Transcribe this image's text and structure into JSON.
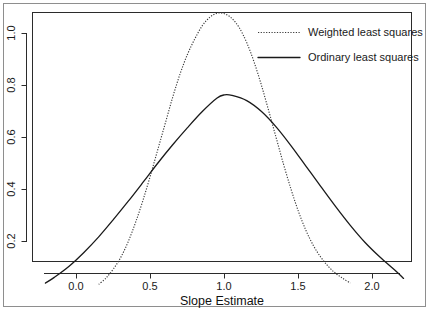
{
  "chart_data": {
    "type": "line",
    "title": "",
    "subtitle": "",
    "xlabel": "Slope Estimate",
    "ylabel": "",
    "xlim": [
      -0.33,
      2.33
    ],
    "ylim": [
      0.0,
      1.13
    ],
    "xticks": [
      0.0,
      0.5,
      1.0,
      1.5,
      2.0
    ],
    "xtick_labels": [
      "0.0",
      "0.5",
      "1.0",
      "1.5",
      "2.0"
    ],
    "yticks": [
      0.2,
      0.4,
      0.6,
      0.8,
      1.0
    ],
    "ytick_labels": [
      "0.2",
      "0.4",
      "0.6",
      "0.8",
      "1.0"
    ],
    "grid": false,
    "legend_position": "top-right",
    "series": [
      {
        "name": "Weighted least squares",
        "style": "dotted",
        "color": "#3a3a3a",
        "peak_x": 0.96,
        "peak_y": 1.08,
        "x_start": 0.15,
        "x_end": 1.85,
        "x": [
          0.15,
          0.2,
          0.25,
          0.3,
          0.35,
          0.4,
          0.45,
          0.5,
          0.55,
          0.6,
          0.65,
          0.7,
          0.75,
          0.8,
          0.85,
          0.9,
          0.95,
          1.0,
          1.05,
          1.1,
          1.15,
          1.2,
          1.25,
          1.3,
          1.35,
          1.4,
          1.45,
          1.5,
          1.55,
          1.6,
          1.65,
          1.7,
          1.75,
          1.8,
          1.85
        ],
        "y": [
          0.035,
          0.06,
          0.095,
          0.14,
          0.2,
          0.275,
          0.36,
          0.455,
          0.555,
          0.655,
          0.755,
          0.845,
          0.92,
          0.98,
          1.03,
          1.062,
          1.078,
          1.076,
          1.058,
          1.022,
          0.965,
          0.89,
          0.8,
          0.7,
          0.597,
          0.495,
          0.4,
          0.315,
          0.243,
          0.185,
          0.14,
          0.105,
          0.078,
          0.058,
          0.04
        ]
      },
      {
        "name": "Ordinary least squares",
        "style": "solid",
        "color": "#1a1a1a",
        "peak_x": 0.99,
        "peak_y": 0.765,
        "x_start": -0.21,
        "x_end": 2.21,
        "x": [
          -0.21,
          -0.15,
          -0.05,
          0.05,
          0.15,
          0.25,
          0.35,
          0.45,
          0.55,
          0.65,
          0.75,
          0.85,
          0.95,
          1.0,
          1.05,
          1.15,
          1.25,
          1.35,
          1.45,
          1.55,
          1.65,
          1.75,
          1.85,
          1.95,
          2.05,
          2.15,
          2.21
        ],
        "y": [
          0.04,
          0.062,
          0.105,
          0.158,
          0.218,
          0.285,
          0.355,
          0.428,
          0.502,
          0.572,
          0.638,
          0.7,
          0.752,
          0.764,
          0.762,
          0.742,
          0.7,
          0.64,
          0.568,
          0.49,
          0.412,
          0.335,
          0.262,
          0.196,
          0.14,
          0.09,
          0.058
        ]
      }
    ],
    "crossings": [
      {
        "x": 0.5,
        "y": 0.47
      },
      {
        "x": 1.48,
        "y": 0.47
      }
    ]
  },
  "legend": {
    "items": [
      {
        "label": "Weighted least squares",
        "style": "dotted"
      },
      {
        "label": "Ordinary least squares",
        "style": "solid"
      }
    ]
  },
  "axis": {
    "x_title": "Slope Estimate"
  }
}
